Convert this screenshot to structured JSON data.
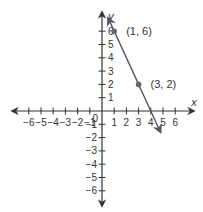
{
  "chart_data": {
    "type": "line",
    "title": "",
    "xlabel": "x",
    "ylabel": "y",
    "xlim": [
      -6,
      6
    ],
    "ylim": [
      -6,
      6
    ],
    "x_ticks": [
      -6,
      -5,
      -4,
      -3,
      -2,
      -1,
      1,
      2,
      3,
      4,
      5,
      6
    ],
    "y_ticks": [
      -6,
      -5,
      -4,
      -3,
      -2,
      -1,
      1,
      2,
      3,
      4,
      5,
      6
    ],
    "origin_label": "0",
    "grid": false,
    "legend": null,
    "series": [
      {
        "name": "y = -2x + 8",
        "equation": "y = -2x + 8",
        "slope": -2,
        "intercept": 8,
        "line_extent": [
          [
            0.5,
            7
          ],
          [
            4.8,
            -1.6
          ]
        ],
        "arrows": "both",
        "color": "#555566"
      }
    ],
    "points": [
      {
        "x": 1,
        "y": 6,
        "label": "(1, 6)"
      },
      {
        "x": 3,
        "y": 2,
        "label": "(3, 2)"
      }
    ]
  },
  "labels": {
    "x_axis": "x",
    "y_axis": "y",
    "origin": "0",
    "point_a": "(1, 6)",
    "point_b": "(3, 2)"
  }
}
